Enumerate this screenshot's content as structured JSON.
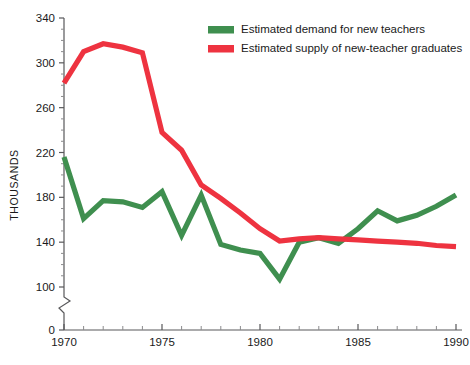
{
  "chart_data": {
    "type": "line",
    "title": "",
    "xlabel": "",
    "ylabel": "THOUSANDS",
    "xlim": [
      1970,
      1990
    ],
    "ylim": [
      100,
      340
    ],
    "y_axis_break": true,
    "y_break_baseline": 0,
    "grid": false,
    "legend_position": "top-right",
    "x": [
      1970,
      1971,
      1972,
      1973,
      1974,
      1975,
      1976,
      1977,
      1978,
      1979,
      1980,
      1981,
      1982,
      1983,
      1984,
      1985,
      1986,
      1987,
      1988,
      1989,
      1990
    ],
    "xticks": [
      1970,
      1975,
      1980,
      1985,
      1990
    ],
    "xtick_labels": [
      "1970",
      "1975",
      "1980",
      "1985",
      "1990"
    ],
    "yticks": [
      0,
      100,
      140,
      180,
      220,
      260,
      300,
      340
    ],
    "ytick_labels": [
      "0",
      "100",
      "140",
      "180",
      "220",
      "260",
      "300",
      "340"
    ],
    "series": [
      {
        "name": "Estimated demand for new teachers",
        "color": "#3f8f4f",
        "values": [
          216,
          161,
          177,
          176,
          171,
          185,
          146,
          182,
          138,
          133,
          130,
          107,
          140,
          144,
          139,
          152,
          168,
          159,
          164,
          172,
          182
        ]
      },
      {
        "name": "Estimated supply of new-teacher graduates",
        "color": "#ee3340",
        "values": [
          282,
          310,
          317,
          314,
          309,
          238,
          222,
          191,
          179,
          166,
          152,
          141,
          143,
          144,
          143,
          142,
          141,
          140,
          139,
          137,
          136
        ]
      }
    ]
  },
  "legend": {
    "items": [
      {
        "label": "Estimated demand for new teachers",
        "color": "#3f8f4f"
      },
      {
        "label": "Estimated supply of new-teacher graduates",
        "color": "#ee3340"
      }
    ]
  },
  "axes": {
    "y_title": "THOUSANDS"
  }
}
